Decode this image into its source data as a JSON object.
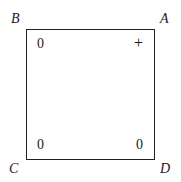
{
  "diagram": {
    "type": "square with labeled vertices and corner values",
    "vertices": [
      {
        "name": "B",
        "position": "top-left"
      },
      {
        "name": "A",
        "position": "top-right"
      },
      {
        "name": "C",
        "position": "bottom-left"
      },
      {
        "name": "D",
        "position": "bottom-right"
      }
    ],
    "corner_values": {
      "B": "0",
      "A": "+",
      "C": "0",
      "D": "0"
    }
  }
}
